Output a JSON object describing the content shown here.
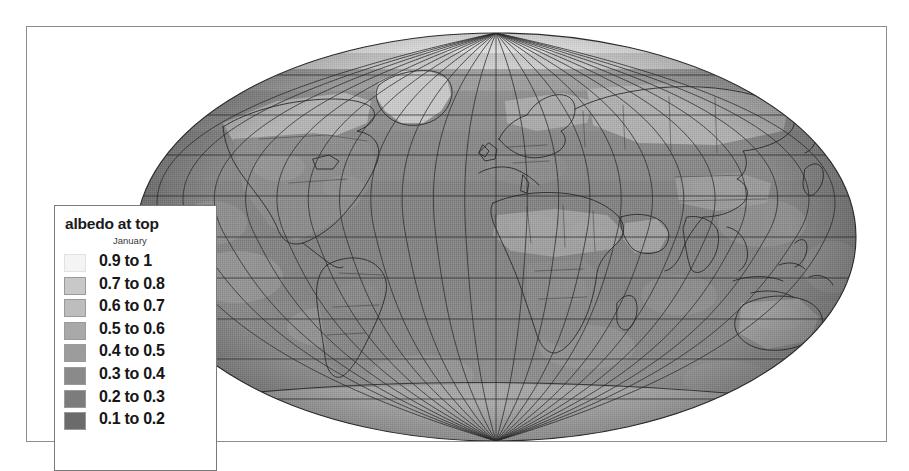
{
  "figure": {
    "background": "#ffffff",
    "frame_color": "#8d8d8d"
  },
  "legend": {
    "title": "albedo at top",
    "subtitle": "January",
    "border_color": "#7a7a7a",
    "entries": [
      {
        "label": "0.9 to 1",
        "color": "#f4f4f4",
        "value_min": 0.9,
        "value_max": 1.0
      },
      {
        "label": "0.7 to 0.8",
        "color": "#c8c8c8",
        "value_min": 0.7,
        "value_max": 0.8
      },
      {
        "label": "0.6 to 0.7",
        "color": "#bdbdbd",
        "value_min": 0.6,
        "value_max": 0.7
      },
      {
        "label": "0.5 to 0.6",
        "color": "#a9a9a9",
        "value_min": 0.5,
        "value_max": 0.6
      },
      {
        "label": "0.4 to 0.5",
        "color": "#9c9c9c",
        "value_min": 0.4,
        "value_max": 0.5
      },
      {
        "label": "0.3 to 0.4",
        "color": "#8a8a8a",
        "value_min": 0.3,
        "value_max": 0.4
      },
      {
        "label": "0.2 to 0.3",
        "color": "#7c7c7c",
        "value_min": 0.2,
        "value_max": 0.3
      },
      {
        "label": "0.1 to 0.2",
        "color": "#6b6b6b",
        "value_min": 0.1,
        "value_max": 0.2
      }
    ]
  },
  "chart_data": {
    "type": "heatmap",
    "title": "albedo at top",
    "subtitle": "January",
    "variable": "albedo at top",
    "period": "January",
    "projection": "mollweide-globe",
    "xlabel": "",
    "ylabel": "",
    "legend_position": "left",
    "grid": true,
    "graticule": {
      "meridian_step_deg": 15,
      "parallel_step_deg": 15,
      "line_color": "#2b2b2b"
    },
    "axis_ranges": {
      "longitude": [
        -180,
        180
      ],
      "latitude": [
        -90,
        90
      ]
    },
    "value_range": [
      0.1,
      1.0
    ],
    "bins": [
      {
        "label": "0.9 to 1",
        "min": 0.9,
        "max": 1.0,
        "color": "#f4f4f4"
      },
      {
        "label": "0.7 to 0.8",
        "min": 0.7,
        "max": 0.8,
        "color": "#c8c8c8"
      },
      {
        "label": "0.6 to 0.7",
        "min": 0.6,
        "max": 0.7,
        "color": "#bdbdbd"
      },
      {
        "label": "0.5 to 0.6",
        "min": 0.5,
        "max": 0.6,
        "color": "#a9a9a9"
      },
      {
        "label": "0.4 to 0.5",
        "min": 0.4,
        "max": 0.5,
        "color": "#9c9c9c"
      },
      {
        "label": "0.3 to 0.4",
        "min": 0.3,
        "max": 0.4,
        "color": "#8a8a8a"
      },
      {
        "label": "0.2 to 0.3",
        "min": 0.2,
        "max": 0.3,
        "color": "#7c7c7c"
      },
      {
        "label": "0.1 to 0.2",
        "min": 0.1,
        "max": 0.2,
        "color": "#6b6b6b"
      }
    ],
    "regions": [
      {
        "name": "arctic-polar-cap",
        "band": "0.9 to 1",
        "value": 0.95
      },
      {
        "name": "greenland",
        "band": "0.7 to 0.8",
        "value": 0.75
      },
      {
        "name": "northern-eurasia-snow",
        "band": "0.6 to 0.7",
        "value": 0.65
      },
      {
        "name": "northern-north-america-snow",
        "band": "0.6 to 0.7",
        "value": 0.65
      },
      {
        "name": "sahara-desert",
        "band": "0.4 to 0.5",
        "value": 0.45
      },
      {
        "name": "arabian-peninsula",
        "band": "0.4 to 0.5",
        "value": 0.45
      },
      {
        "name": "south-america",
        "band": "0.3 to 0.4",
        "value": 0.35
      },
      {
        "name": "southern-africa",
        "band": "0.3 to 0.4",
        "value": 0.35
      },
      {
        "name": "australia",
        "band": "0.3 to 0.4",
        "value": 0.35
      },
      {
        "name": "tropical-ocean",
        "band": "0.2 to 0.3",
        "value": 0.25
      },
      {
        "name": "southern-ocean",
        "band": "0.3 to 0.4",
        "value": 0.35
      },
      {
        "name": "antarctica",
        "band": "0.5 to 0.6",
        "value": 0.55
      }
    ]
  }
}
